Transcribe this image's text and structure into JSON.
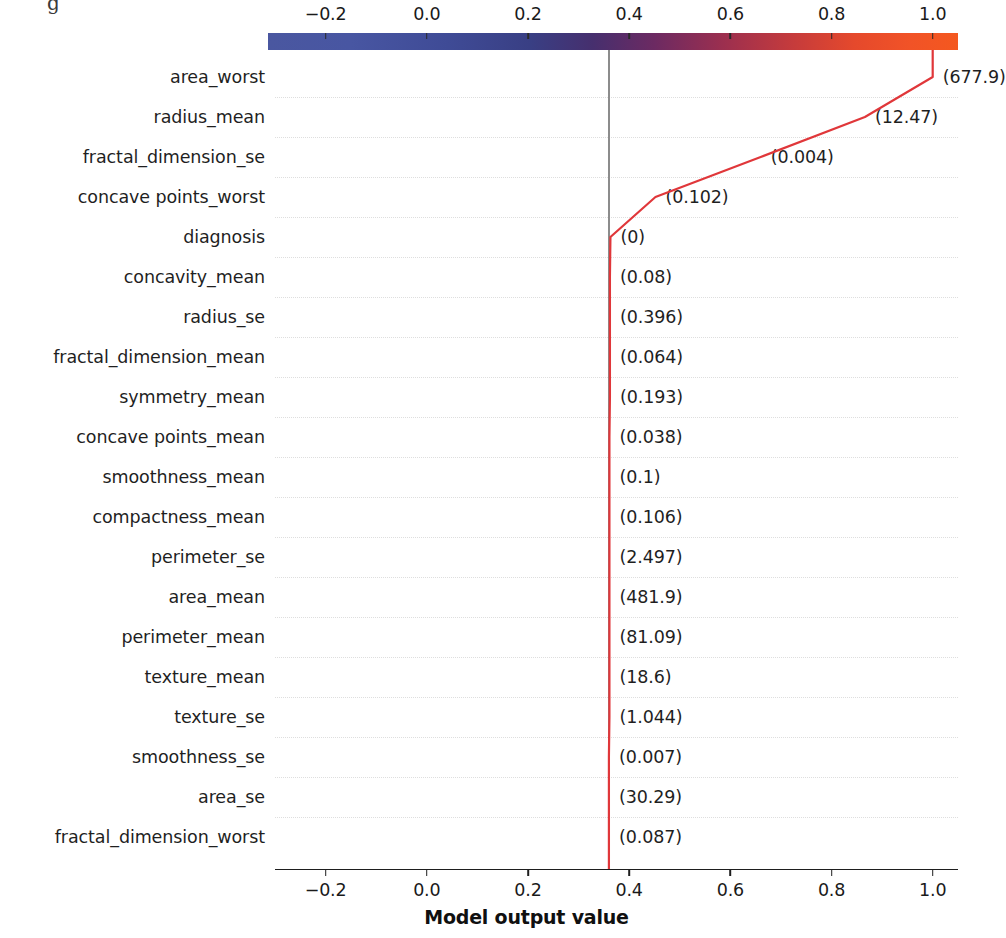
{
  "colorbar": {
    "name": "model-output-colorbar",
    "tick_labels": [
      "−0.2",
      "0.0",
      "0.2",
      "0.4",
      "0.6",
      "0.8",
      "1.0"
    ],
    "tick_values": [
      -0.2,
      0.0,
      0.2,
      0.4,
      0.6,
      0.8,
      1.0
    ],
    "low_color": "#4a57a0",
    "mid_color": "#6c2a62",
    "high_color": "#f4581f"
  },
  "xaxis": {
    "title": "Model output value",
    "tick_labels": [
      "−0.2",
      "0.0",
      "0.2",
      "0.4",
      "0.6",
      "0.8",
      "1.0"
    ],
    "tick_values": [
      -0.2,
      0.0,
      0.2,
      0.4,
      0.6,
      0.8,
      1.0
    ],
    "range": [
      -0.3,
      1.05
    ]
  },
  "reference": {
    "base_value": 0.36,
    "line_color": "#8c8c8c"
  },
  "line": {
    "color": "#e0373a",
    "width": 2.2
  },
  "top_artifact": "g",
  "chart_data": {
    "type": "line",
    "title": "",
    "subtitle": "",
    "xlabel": "Model output value",
    "ylabel": "",
    "xlim": [
      -0.3,
      1.05
    ],
    "grid": true,
    "legend": "none",
    "orientation": "horizontal-cumulative",
    "base_value": 0.36,
    "final_output": 1.0,
    "features": [
      {
        "label": "area_worst",
        "value": "(677.9)",
        "feature_value": 677.9,
        "cumulative": 1.0
      },
      {
        "label": "radius_mean",
        "value": "(12.47)",
        "feature_value": 12.47,
        "cumulative": 0.866
      },
      {
        "label": "fractal_dimension_se",
        "value": "(0.004)",
        "feature_value": 0.004,
        "cumulative": 0.66
      },
      {
        "label": "concave points_worst",
        "value": "(0.102)",
        "feature_value": 0.102,
        "cumulative": 0.452
      },
      {
        "label": "diagnosis",
        "value": "(0)",
        "feature_value": 0,
        "cumulative": 0.363
      },
      {
        "label": "concavity_mean",
        "value": "(0.08)",
        "feature_value": 0.08,
        "cumulative": 0.362
      },
      {
        "label": "radius_se",
        "value": "(0.396)",
        "feature_value": 0.396,
        "cumulative": 0.362
      },
      {
        "label": "fractal_dimension_mean",
        "value": "(0.064)",
        "feature_value": 0.064,
        "cumulative": 0.362
      },
      {
        "label": "symmetry_mean",
        "value": "(0.193)",
        "feature_value": 0.193,
        "cumulative": 0.362
      },
      {
        "label": "concave points_mean",
        "value": "(0.038)",
        "feature_value": 0.038,
        "cumulative": 0.361
      },
      {
        "label": "smoothness_mean",
        "value": "(0.1)",
        "feature_value": 0.1,
        "cumulative": 0.361
      },
      {
        "label": "compactness_mean",
        "value": "(0.106)",
        "feature_value": 0.106,
        "cumulative": 0.361
      },
      {
        "label": "perimeter_se",
        "value": "(2.497)",
        "feature_value": 2.497,
        "cumulative": 0.361
      },
      {
        "label": "area_mean",
        "value": "(481.9)",
        "feature_value": 481.9,
        "cumulative": 0.361
      },
      {
        "label": "perimeter_mean",
        "value": "(81.09)",
        "feature_value": 81.09,
        "cumulative": 0.361
      },
      {
        "label": "texture_mean",
        "value": "(18.6)",
        "feature_value": 18.6,
        "cumulative": 0.361
      },
      {
        "label": "texture_se",
        "value": "(1.044)",
        "feature_value": 1.044,
        "cumulative": 0.361
      },
      {
        "label": "smoothness_se",
        "value": "(0.007)",
        "feature_value": 0.007,
        "cumulative": 0.36
      },
      {
        "label": "area_se",
        "value": "(30.29)",
        "feature_value": 30.29,
        "cumulative": 0.36
      },
      {
        "label": "fractal_dimension_worst",
        "value": "(0.087)",
        "feature_value": 0.087,
        "cumulative": 0.36
      }
    ]
  }
}
